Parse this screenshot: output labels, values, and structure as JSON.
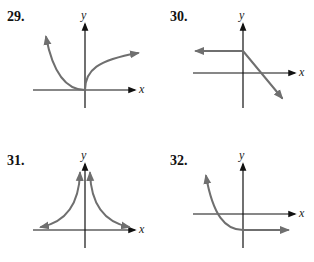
{
  "colors": {
    "axis": "#111111",
    "curve": "#6f6f6f",
    "background": "#ffffff"
  },
  "graphs": [
    {
      "number": "29.",
      "x_label": "x",
      "y_label": "y",
      "description": "Left branch decreasing to origin from upper-left; right branch increasing, concave down (square-root-like) from origin"
    },
    {
      "number": "30.",
      "x_label": "x",
      "y_label": "y",
      "description": "Horizontal ray to the left at positive y-level, then line decreasing through x-axis to lower right"
    },
    {
      "number": "31.",
      "x_label": "x",
      "y_label": "y",
      "description": "Symmetric about y-axis, two branches rising toward y-axis (vertical asymptote), approaching x-axis as |x| grows"
    },
    {
      "number": "32.",
      "x_label": "x",
      "y_label": "y",
      "description": "Decreasing curve from upper-left crossing x-axis left of origin, leveling to a horizontal ray below x-axis"
    }
  ]
}
